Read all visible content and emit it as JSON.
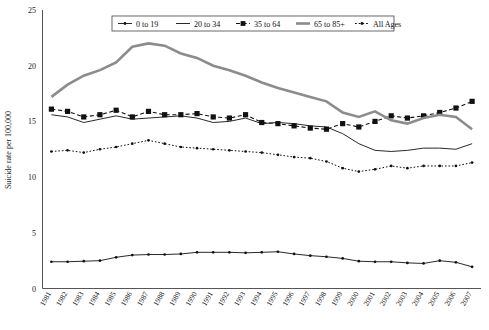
{
  "chart_data": {
    "type": "line",
    "title": "",
    "xlabel": "",
    "ylabel": "Suicide rate per 100,000",
    "ylim": [
      0,
      25
    ],
    "yticks": [
      0,
      5,
      10,
      15,
      20,
      25
    ],
    "grid": false,
    "legend_position": "top-center",
    "categories": [
      "1981",
      "1982",
      "1983",
      "1984",
      "1985",
      "1986",
      "1987",
      "1988",
      "1989",
      "1990",
      "1991",
      "1992",
      "1993",
      "1994",
      "1995",
      "1996",
      "1997",
      "1998",
      "1999",
      "2000",
      "2001",
      "2002",
      "2003",
      "2004",
      "2005",
      "2006",
      "2007"
    ],
    "series": [
      {
        "name": "0 to 19",
        "marker": "small-dot",
        "line_style": "solid-thin",
        "color": "#111111",
        "values": [
          2.4,
          2.4,
          2.45,
          2.5,
          2.8,
          3.0,
          3.05,
          3.05,
          3.1,
          3.25,
          3.25,
          3.25,
          3.2,
          3.25,
          3.3,
          3.1,
          2.95,
          2.85,
          2.7,
          2.45,
          2.4,
          2.4,
          2.3,
          2.25,
          2.5,
          2.35,
          1.95
        ]
      },
      {
        "name": "20 to 34",
        "marker": "none",
        "line_style": "solid-thin",
        "color": "#111111",
        "values": [
          15.6,
          15.4,
          14.9,
          15.2,
          15.5,
          15.2,
          15.3,
          15.4,
          15.5,
          15.3,
          14.9,
          15.0,
          15.3,
          14.8,
          14.9,
          14.8,
          14.6,
          14.5,
          13.9,
          13.0,
          12.4,
          12.3,
          12.4,
          12.6,
          12.6,
          12.5,
          13.0
        ]
      },
      {
        "name": "35 to 64",
        "marker": "filled-square",
        "line_style": "dashed",
        "color": "#111111",
        "values": [
          16.1,
          15.9,
          15.4,
          15.6,
          16.0,
          15.4,
          15.9,
          15.6,
          15.6,
          15.7,
          15.4,
          15.3,
          15.6,
          14.9,
          14.8,
          14.6,
          14.4,
          14.3,
          14.8,
          14.5,
          15.0,
          15.5,
          15.3,
          15.5,
          15.8,
          16.2,
          16.8
        ]
      },
      {
        "name": "65 to 85+",
        "marker": "none",
        "line_style": "solid-thick",
        "color": "#8c8c8c",
        "values": [
          17.2,
          18.3,
          19.1,
          19.6,
          20.3,
          21.7,
          22.0,
          21.8,
          21.1,
          20.7,
          20.0,
          19.6,
          19.1,
          18.5,
          18.0,
          17.6,
          17.2,
          16.8,
          15.8,
          15.4,
          15.9,
          15.1,
          14.8,
          15.3,
          15.6,
          15.4,
          14.3
        ]
      },
      {
        "name": "All Ages",
        "marker": "small-dot",
        "line_style": "dotted",
        "color": "#111111",
        "values": [
          12.3,
          12.4,
          12.2,
          12.5,
          12.7,
          13.0,
          13.3,
          13.0,
          12.7,
          12.6,
          12.5,
          12.4,
          12.3,
          12.2,
          12.0,
          11.8,
          11.7,
          11.4,
          10.8,
          10.5,
          10.7,
          11.0,
          10.8,
          11.0,
          11.0,
          11.0,
          11.3
        ]
      }
    ]
  },
  "axis": {
    "y_tick_labels": [
      "0",
      "5",
      "10",
      "15",
      "20",
      "25"
    ],
    "y_axis_title": "Suicide rate per 100,000"
  },
  "legend": {
    "entries": [
      {
        "label": "0 to 19"
      },
      {
        "label": "20 to 34"
      },
      {
        "label": "35 to 64"
      },
      {
        "label": "65 to 85+"
      },
      {
        "label": "All Ages"
      }
    ]
  }
}
